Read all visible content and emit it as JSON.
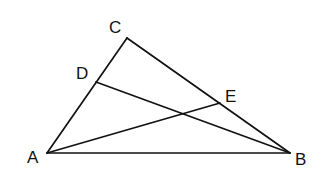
{
  "diagram": {
    "title": "",
    "stroke_color": "#111111",
    "background": "#ffffff",
    "points": {
      "A": {
        "x": 47,
        "y": 153,
        "label": "A",
        "lx": 27,
        "ly": 163
      },
      "B": {
        "x": 290,
        "y": 153,
        "label": "B",
        "lx": 295,
        "ly": 165
      },
      "C": {
        "x": 127,
        "y": 38,
        "label": "C",
        "lx": 109,
        "ly": 33
      },
      "D": {
        "x": 96,
        "y": 82,
        "label": "D",
        "lx": 76,
        "ly": 79
      },
      "E": {
        "x": 220,
        "y": 103,
        "label": "E",
        "lx": 225,
        "ly": 102
      }
    },
    "segments": [
      {
        "name": "segment-AB",
        "from": "A",
        "to": "B"
      },
      {
        "name": "segment-AC",
        "from": "A",
        "to": "C"
      },
      {
        "name": "segment-CB",
        "from": "C",
        "to": "B"
      },
      {
        "name": "segment-DB",
        "from": "D",
        "to": "B"
      },
      {
        "name": "segment-AE",
        "from": "A",
        "to": "E"
      }
    ]
  }
}
